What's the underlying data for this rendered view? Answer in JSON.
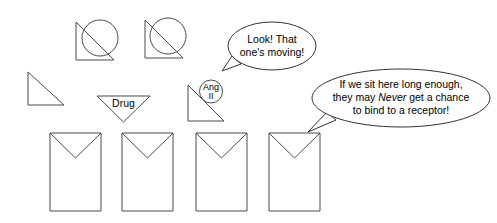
{
  "diagram": {
    "colors": {
      "stroke": "#4a4a4a",
      "bubble_stroke": "#333333",
      "text": "#000000",
      "background": "#ffffff"
    },
    "labels": {
      "drug": "Drug",
      "ang_line1": "Ang",
      "ang_line2": "II"
    },
    "bubbles": [
      {
        "id": "bubble-moving",
        "lines": [
          "Look! That",
          "one's moving!"
        ]
      },
      {
        "id": "bubble-receptor",
        "line1": "If we sit here long enough,",
        "line2_a": "they may ",
        "line2_em": "Never",
        "line2_b": " get a chance",
        "line3": "to bind to a receptor!"
      }
    ],
    "shapes": {
      "free_triangle_count": "1",
      "triangle_circle_pair_count": "2",
      "receptor_count": "4",
      "drug_triangle_count": "1",
      "ang_molecule_count": "1"
    }
  }
}
